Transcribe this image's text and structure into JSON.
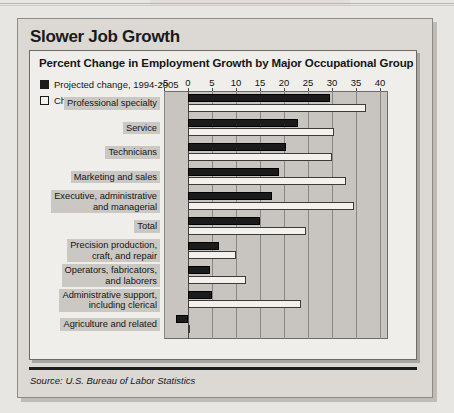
{
  "figure": {
    "title": "Slower Job Growth",
    "source": "Source: U.S. Bureau of Labor Statistics"
  },
  "chart_data": {
    "type": "bar",
    "orientation": "horizontal",
    "title": "Percent Change in Employment Growth by Major Occupational Group",
    "xlabel": "",
    "ylabel": "",
    "xlim": [
      -5,
      40
    ],
    "xticks": [
      -5,
      0,
      5,
      10,
      15,
      20,
      25,
      30,
      35,
      40
    ],
    "xtick_labels": [
      "-5",
      "0",
      "5",
      "10",
      "15",
      "20",
      "25",
      "30",
      "35",
      "40"
    ],
    "grid": "vertical",
    "legend_position": "top-left",
    "categories": [
      "Professional specialty",
      "Service",
      "Technicians",
      "Marketing and sales",
      "Executive, administrative and managerial",
      "Total",
      "Precision production, craft, and repair",
      "Operators, fabricators, and laborers",
      "Administrative support, including clerical",
      "Agriculture and related"
    ],
    "category_lines": [
      [
        "Professional specialty"
      ],
      [
        "Service"
      ],
      [
        "Technicians"
      ],
      [
        "Marketing and sales"
      ],
      [
        "Executive, administrative",
        "and managerial"
      ],
      [
        "Total"
      ],
      [
        "Precision production,",
        "craft, and repair"
      ],
      [
        "Operators, fabricators,",
        "and laborers"
      ],
      [
        "Administrative support,",
        "including clerical"
      ],
      [
        "Agriculture and related"
      ]
    ],
    "series": [
      {
        "name": "Projected change, 1994-2005",
        "color": "#1b1b1b",
        "values": [
          29.5,
          23.0,
          20.5,
          19.0,
          17.5,
          15.0,
          6.5,
          4.5,
          5.0,
          -2.5
        ]
      },
      {
        "name": "Change, 1983-94",
        "color": "#f2f1ed",
        "values": [
          37.0,
          30.5,
          30.0,
          33.0,
          34.5,
          24.5,
          10.0,
          12.0,
          23.5,
          0.5
        ]
      }
    ]
  }
}
